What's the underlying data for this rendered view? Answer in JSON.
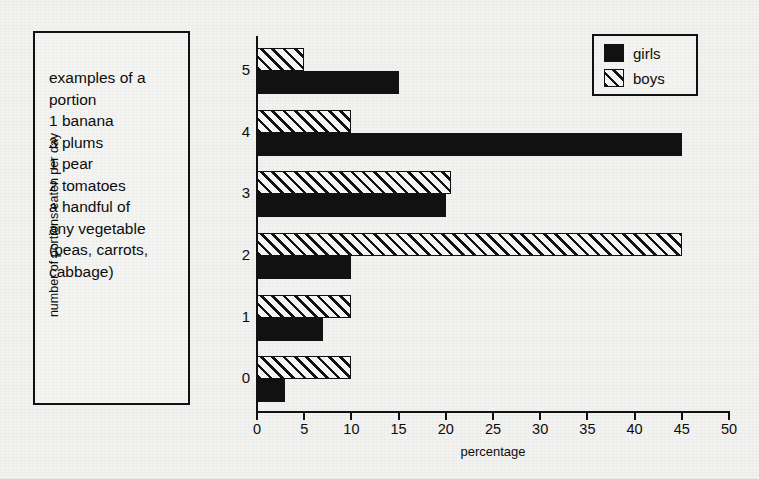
{
  "note_box": {
    "lines": [
      "examples of a",
      "portion",
      "1 banana",
      "3 plums",
      "1 pear",
      "2 tomatoes",
      "a handful of",
      "any vegetable",
      "(peas, carrots,",
      "cabbage)"
    ]
  },
  "legend": {
    "position": "top-right",
    "entries": [
      {
        "label": "girls",
        "fill": "solid",
        "color": "#111111"
      },
      {
        "label": "boys",
        "fill": "diagonal-hatch",
        "color": "#111111"
      }
    ]
  },
  "chart_data": {
    "type": "bar",
    "orientation": "horizontal",
    "title": "",
    "xlabel": "percentage",
    "ylabel": "number of portions eaten per day",
    "categories": [
      "0",
      "1",
      "2",
      "3",
      "4",
      "5"
    ],
    "xticks": [
      "0",
      "5",
      "10",
      "15",
      "20",
      "25",
      "30",
      "35",
      "40",
      "45",
      "50"
    ],
    "xlim": [
      0,
      50
    ],
    "grid": false,
    "legend_position": "top-right",
    "series": [
      {
        "name": "girls",
        "values": [
          3,
          7,
          10,
          20,
          45,
          15
        ]
      },
      {
        "name": "boys",
        "values": [
          10,
          10,
          45,
          20.5,
          10,
          5
        ]
      }
    ]
  }
}
